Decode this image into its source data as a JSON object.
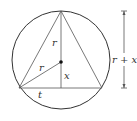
{
  "diagram": {
    "labels": {
      "r_upper": "r",
      "r_slant": "r",
      "x": "x",
      "t": "t",
      "dimension": "r + x"
    },
    "colors": {
      "stroke": "#444444",
      "circle": "#333333",
      "text": "#333333",
      "background": "#ffffff"
    }
  }
}
